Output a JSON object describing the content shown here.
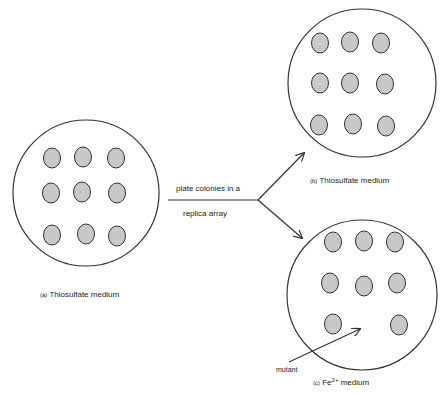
{
  "diagram": {
    "colors": {
      "stroke": "#333333",
      "colony_fill": "#c8c8c8",
      "background": "#ffffff"
    },
    "plates": [
      {
        "id": "a",
        "label_prefix": "(a)",
        "label": "Thiosulfate medium",
        "cx": 86,
        "cy": 193,
        "r": 73,
        "colonies": [
          {
            "x": 52,
            "y": 158
          },
          {
            "x": 83,
            "y": 157
          },
          {
            "x": 116,
            "y": 158
          },
          {
            "x": 51,
            "y": 193
          },
          {
            "x": 82,
            "y": 192
          },
          {
            "x": 117,
            "y": 193
          },
          {
            "x": 52,
            "y": 235
          },
          {
            "x": 86,
            "y": 234
          },
          {
            "x": 117,
            "y": 236
          }
        ]
      },
      {
        "id": "b",
        "label_prefix": "(b)",
        "label": "Thiosulfate medium",
        "cx": 362,
        "cy": 83,
        "r": 74,
        "colonies": [
          {
            "x": 320,
            "y": 43
          },
          {
            "x": 350,
            "y": 42
          },
          {
            "x": 381,
            "y": 43
          },
          {
            "x": 320,
            "y": 83
          },
          {
            "x": 350,
            "y": 83
          },
          {
            "x": 385,
            "y": 84
          },
          {
            "x": 319,
            "y": 125
          },
          {
            "x": 353,
            "y": 124
          },
          {
            "x": 386,
            "y": 126
          }
        ]
      },
      {
        "id": "c",
        "label_prefix": "(c)",
        "label": "Fe",
        "label_sup": "2+",
        "label_suffix": "medium",
        "cx": 362,
        "cy": 295,
        "r": 75,
        "colonies": [
          {
            "x": 333,
            "y": 242
          },
          {
            "x": 364,
            "y": 241
          },
          {
            "x": 395,
            "y": 242
          },
          {
            "x": 330,
            "y": 283
          },
          {
            "x": 364,
            "y": 286
          },
          {
            "x": 397,
            "y": 283
          },
          {
            "x": 333,
            "y": 324
          },
          {
            "x": 399,
            "y": 325
          }
        ]
      }
    ],
    "transfer": {
      "line_text_top": "plate colonies in a",
      "line_text_bottom": "replica array"
    },
    "annotation": {
      "mutant_label": "mutant"
    }
  }
}
